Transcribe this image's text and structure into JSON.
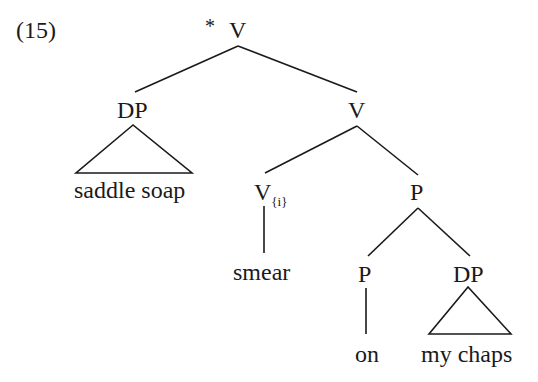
{
  "example_number": "(15)",
  "tree": {
    "root": {
      "star": "*",
      "label": "V"
    },
    "dp_subject": {
      "label": "DP",
      "text": "saddle soap"
    },
    "v_bar": {
      "label": "V"
    },
    "v_head": {
      "label": "V",
      "subscript": "{i}",
      "text": "smear"
    },
    "p_bar": {
      "label": "P"
    },
    "p_head": {
      "label": "P",
      "text": "on"
    },
    "dp_object": {
      "label": "DP",
      "text": "my chaps"
    }
  }
}
